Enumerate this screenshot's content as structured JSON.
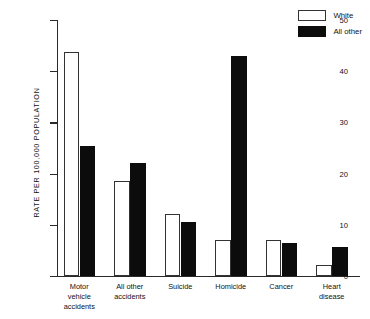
{
  "chart_data": {
    "type": "bar",
    "title": "",
    "xlabel": "",
    "ylabel": "RATE PER 100,000 POPULATION",
    "ylim": [
      0,
      50
    ],
    "yticks": [
      0,
      10,
      20,
      30,
      40,
      50
    ],
    "ytick_labels": [
      "0",
      "10",
      "20",
      "30",
      "40",
      "50"
    ],
    "grid": false,
    "legend_position": "top-right",
    "categories": [
      "Motor vehicle accidents",
      "All other accidents",
      "Suicide",
      "Homicide",
      "Cancer",
      "Heart disease"
    ],
    "category_lines": [
      [
        "Motor",
        "vehicle",
        "accidents"
      ],
      [
        "All other",
        "accidents"
      ],
      [
        "Suicide"
      ],
      [
        "Homicide"
      ],
      [
        "Cancer"
      ],
      [
        "Heart",
        "disease"
      ]
    ],
    "series": [
      {
        "name": "White",
        "color": "#ffffff",
        "values": [
          43.7,
          18.6,
          12.2,
          7.1,
          7.0,
          2.2
        ]
      },
      {
        "name": "All other",
        "color": "#0c0c0c",
        "values": [
          25.4,
          22.0,
          10.5,
          43.0,
          6.4,
          5.6
        ]
      }
    ]
  },
  "legend": {
    "items": [
      {
        "label": "White",
        "swatch": "open-white-box"
      },
      {
        "label": "All other",
        "swatch": "filled-black-box"
      }
    ]
  }
}
